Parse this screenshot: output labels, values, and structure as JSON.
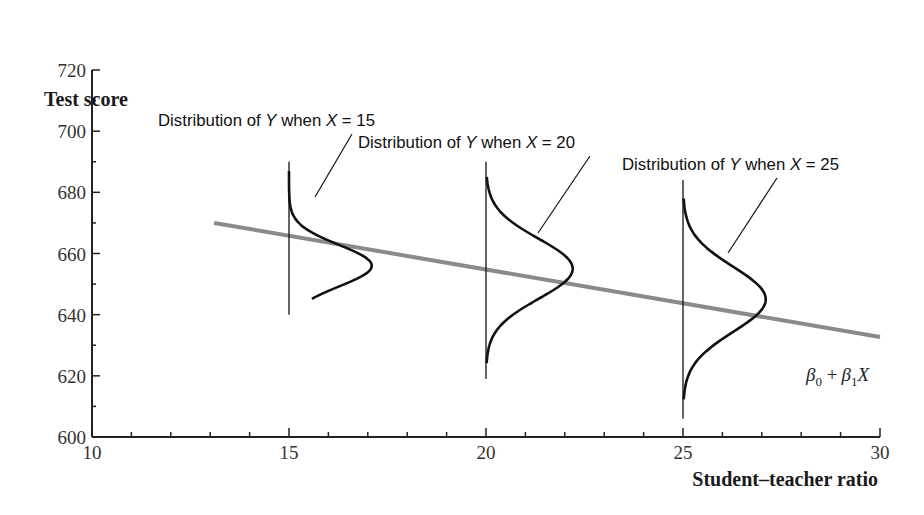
{
  "chart_data": {
    "type": "line",
    "title": "",
    "xlabel": "Student–teacher ratio",
    "ylabel": "Test score",
    "xlim": [
      10,
      30
    ],
    "ylim": [
      600,
      720
    ],
    "x_ticks": [
      10,
      15,
      20,
      25,
      30
    ],
    "x_minor_step": 1,
    "y_ticks": [
      600,
      620,
      640,
      660,
      680,
      700,
      720
    ],
    "y_minor_step": 10,
    "grid": false,
    "regression_line": {
      "label": "β0 + β1X",
      "x_start": 13.1,
      "x_end": 30,
      "y_start": 670,
      "y_end": 632.7,
      "color": "#8a8a8a"
    },
    "distributions": [
      {
        "label": "Distribution of Y when X = 15",
        "x": 15,
        "mean": 656,
        "line_top": 690,
        "line_bottom": 640,
        "curve_top": 687,
        "curve_bottom": 645,
        "peak_width": 2.1
      },
      {
        "label": "Distribution of Y when X = 20",
        "x": 20,
        "mean": 655,
        "line_top": 690,
        "line_bottom": 619,
        "curve_top": 685,
        "curve_bottom": 624,
        "peak_width": 2.2
      },
      {
        "label": "Distribution of Y when X = 25",
        "x": 25,
        "mean": 645,
        "line_top": 684,
        "line_bottom": 606,
        "curve_top": 678,
        "curve_bottom": 612,
        "peak_width": 2.1
      }
    ]
  },
  "labels": {
    "ylabel": "Test score",
    "xlabel": "Student–teacher ratio",
    "dist_prefix": "Distribution of ",
    "dist_y": "Y",
    "dist_mid": " when ",
    "dist_x": "X",
    "dist_eq": " = ",
    "dist_values": [
      "15",
      "20",
      "25"
    ],
    "beta0": "β",
    "sub0": "0",
    "plus": " +",
    "beta1": "β",
    "sub1": "1",
    "xvar": "X"
  }
}
